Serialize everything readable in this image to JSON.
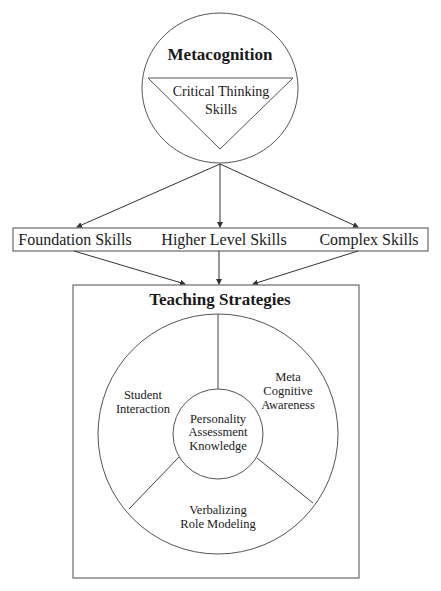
{
  "top": {
    "title": "Metacognition",
    "triangle_lines": [
      "Critical Thinking",
      "Skills"
    ]
  },
  "skills": [
    {
      "label": "Foundation Skills"
    },
    {
      "label": "Higher Level Skills"
    },
    {
      "label": "Complex Skills"
    }
  ],
  "teaching": {
    "title": "Teaching Strategies",
    "center_lines": [
      "Personality",
      "Assessment",
      "Knowledge"
    ],
    "segments": [
      {
        "name": "student-interaction",
        "lines": [
          "Student",
          "Interaction"
        ]
      },
      {
        "name": "meta-cognitive-awareness",
        "lines": [
          "Meta",
          "Cognitive",
          "Awareness"
        ]
      },
      {
        "name": "verbalizing-role-modeling",
        "lines": [
          "Verbalizing",
          "Role Modeling"
        ]
      }
    ]
  },
  "colors": {
    "stroke": "#555555",
    "text": "#1a1a1a",
    "background": "#ffffff"
  }
}
